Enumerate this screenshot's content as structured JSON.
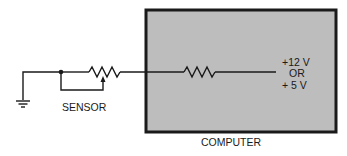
{
  "diagram": {
    "type": "circuit-schematic",
    "labels": {
      "sensor": "SENSOR",
      "computer": "COMPUTER",
      "voltage_line1": "+12 V",
      "voltage_line2": "OR",
      "voltage_line3": "+ 5 V"
    },
    "components": [
      {
        "id": "ground",
        "kind": "ground"
      },
      {
        "id": "sensor",
        "kind": "variable-resistor",
        "label": "SENSOR"
      },
      {
        "id": "pullup",
        "kind": "resistor",
        "inside": "COMPUTER"
      },
      {
        "id": "supply",
        "kind": "voltage-source",
        "label": "+12 V OR + 5 V"
      }
    ],
    "colors": {
      "box_fill": "#bdbdbd",
      "line": "#1a1a1a",
      "background": "#ffffff"
    }
  }
}
